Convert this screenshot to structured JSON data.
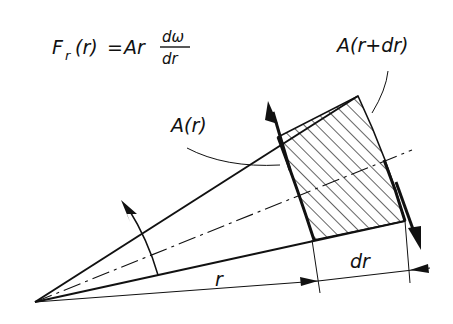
{
  "formula": {
    "lhs": "F",
    "lhs_sub": "r",
    "arg": "(r)",
    "equals": "=",
    "rhs_prefix": "Ar",
    "frac_num": "dω",
    "frac_den": "dr"
  },
  "labels": {
    "area_outer": "A(r+dr)",
    "area_inner": "A(r)",
    "radius": "r",
    "increment": "dr"
  },
  "colors": {
    "ink": "#111111",
    "background": "#ffffff"
  }
}
